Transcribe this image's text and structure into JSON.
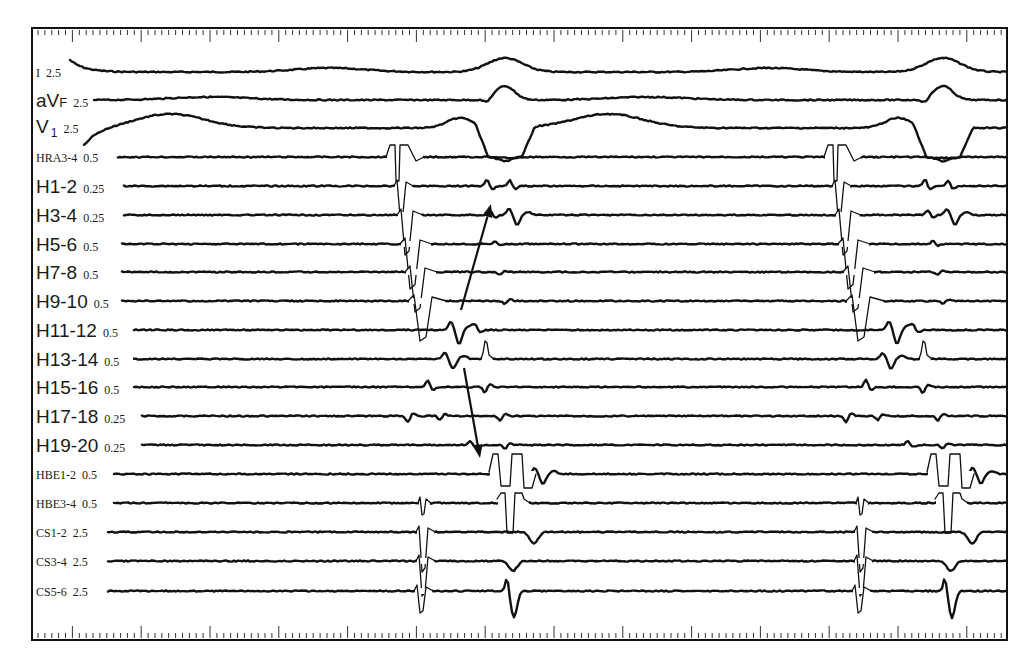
{
  "figure": {
    "type": "intracardiac-electrogram",
    "frame": {
      "left": 31,
      "top": 27,
      "right": 1008,
      "bottom": 641
    },
    "ruler": {
      "start_x": 38,
      "end_x": 1004,
      "minor_spacing": 6.88,
      "major_every": 10,
      "top_y": 30,
      "bottom_y": 638
    },
    "colors": {
      "trace": "#111111",
      "frame": "#111111",
      "label": "#1a1a1a"
    }
  },
  "channels": [
    {
      "id": "I",
      "name": "I",
      "gain": "2.5",
      "style": "serif",
      "y": 72,
      "x0": 70
    },
    {
      "id": "aVF",
      "name": "aV",
      "sub_f": "F",
      "gain": "2.5",
      "style": "sans",
      "y": 100,
      "x0": 94
    },
    {
      "id": "V1",
      "name": "V",
      "sub": "1",
      "gain": "2.5",
      "style": "sans",
      "y": 128,
      "x0": 84
    },
    {
      "id": "HRA3-4",
      "name": "HRA3-4",
      "gain": "0.5",
      "style": "serif",
      "y": 157,
      "x0": 118
    },
    {
      "id": "H1-2",
      "name": "H1-2",
      "gain": "0.25",
      "style": "sans",
      "y": 186,
      "x0": 124
    },
    {
      "id": "H3-4",
      "name": "H3-4",
      "gain": "0.25",
      "style": "sans",
      "y": 215,
      "x0": 124
    },
    {
      "id": "H5-6",
      "name": "H5-6",
      "gain": "0.5",
      "style": "sans",
      "y": 244,
      "x0": 122
    },
    {
      "id": "H7-8",
      "name": "H7-8",
      "gain": "0.5",
      "style": "sans",
      "y": 272,
      "x0": 122
    },
    {
      "id": "H9-10",
      "name": "H9-10",
      "gain": "0.5",
      "style": "sans",
      "y": 301,
      "x0": 122
    },
    {
      "id": "H11-12",
      "name": "H11-12",
      "gain": "0.5",
      "style": "sans",
      "y": 330,
      "x0": 134
    },
    {
      "id": "H13-14",
      "name": "H13-14",
      "gain": "0.5",
      "style": "sans",
      "y": 359,
      "x0": 134
    },
    {
      "id": "H15-16",
      "name": "H15-16",
      "gain": "0.5",
      "style": "sans",
      "y": 387,
      "x0": 134
    },
    {
      "id": "H17-18",
      "name": "H17-18",
      "gain": "0.25",
      "style": "sans",
      "y": 416,
      "x0": 142
    },
    {
      "id": "H19-20",
      "name": "H19-20",
      "gain": "0.25",
      "style": "sans",
      "y": 445,
      "x0": 142
    },
    {
      "id": "HBE1-2",
      "name": "HBE1-2",
      "gain": "0.5",
      "style": "serif",
      "y": 474,
      "x0": 114
    },
    {
      "id": "HBE3-4",
      "name": "HBE3-4",
      "gain": "0.5",
      "style": "serif",
      "y": 503,
      "x0": 114
    },
    {
      "id": "CS1-2",
      "name": "CS1-2",
      "gain": "2.5",
      "style": "serif",
      "y": 532,
      "x0": 108
    },
    {
      "id": "CS3-4",
      "name": "CS3-4",
      "gain": "2.5",
      "style": "serif",
      "y": 561,
      "x0": 108
    },
    {
      "id": "CS5-6",
      "name": "CS5-6",
      "gain": "2.5",
      "style": "serif",
      "y": 591,
      "x0": 108
    }
  ],
  "beats": [
    {
      "x": 0
    },
    {
      "x": 438
    }
  ],
  "events": {
    "I": [
      [
        "hump",
        330,
        -4,
        80
      ],
      [
        "hump",
        505,
        -14,
        40
      ],
      [
        "start",
        70,
        -12
      ]
    ],
    "aVF": [
      [
        "hump",
        210,
        -3,
        90
      ],
      [
        "dip",
        487,
        4,
        8
      ],
      [
        "hump",
        505,
        -14,
        22
      ]
    ],
    "V1": [
      [
        "hump",
        170,
        -14,
        80
      ],
      [
        "hump",
        460,
        -10,
        30
      ],
      [
        "trough",
        505,
        30,
        30
      ],
      [
        "start",
        84,
        18
      ]
    ],
    "HRA3-4": [
      [
        "pace",
        390,
        -12,
        26,
        12
      ],
      [
        "dip",
        505,
        4,
        16
      ]
    ],
    "H1-2": [
      [
        "spike",
        400,
        30,
        6
      ],
      [
        "notch",
        487,
        -7
      ],
      [
        "notch",
        510,
        -6
      ]
    ],
    "H3-4": [
      [
        "spike",
        405,
        40,
        8
      ],
      [
        "notch",
        490,
        -5
      ],
      [
        "wave",
        514,
        10
      ]
    ],
    "H5-6": [
      [
        "spike",
        410,
        45,
        10
      ],
      [
        "notch",
        495,
        -3
      ]
    ],
    "H7-8": [
      [
        "spike",
        415,
        40,
        10
      ],
      [
        "notch",
        500,
        3
      ]
    ],
    "H9-10": [
      [
        "spike",
        420,
        40,
        12
      ],
      [
        "notch",
        505,
        3
      ]
    ],
    "H11-12": [
      [
        "wave",
        456,
        14
      ],
      [
        "notch",
        475,
        -5
      ]
    ],
    "H13-14": [
      [
        "wave",
        450,
        10
      ],
      [
        "spike",
        485,
        -18,
        4
      ]
    ],
    "H15-16": [
      [
        "notch",
        428,
        -7
      ],
      [
        "notch",
        485,
        6
      ]
    ],
    "H17-18": [
      [
        "notch",
        408,
        6
      ],
      [
        "notch",
        440,
        4
      ],
      [
        "notch",
        500,
        5
      ]
    ],
    "H19-20": [
      [
        "notch",
        470,
        -4
      ],
      [
        "notch",
        505,
        4
      ]
    ],
    "HBE1-2": [
      [
        "his",
        495,
        -20,
        520,
        18
      ],
      [
        "wave",
        540,
        10
      ]
    ],
    "HBE3-4": [
      [
        "spike",
        422,
        12,
        4
      ],
      [
        "his2",
        505,
        520,
        30
      ]
    ],
    "CS1-2": [
      [
        "spike",
        422,
        40,
        6
      ],
      [
        "dip",
        534,
        12,
        10
      ]
    ],
    "CS3-4": [
      [
        "spike",
        422,
        35,
        6
      ],
      [
        "dip",
        513,
        10,
        10
      ]
    ],
    "CS5-6": [
      [
        "spike",
        420,
        22,
        6
      ],
      [
        "biphasic",
        510,
        -14,
        30
      ]
    ]
  },
  "annotations": {
    "arrows": [
      {
        "name": "arrow-up",
        "x1": 461,
        "y1": 310,
        "x2": 491,
        "y2": 204
      },
      {
        "name": "arrow-down",
        "x1": 464,
        "y1": 368,
        "x2": 480,
        "y2": 458
      }
    ]
  }
}
